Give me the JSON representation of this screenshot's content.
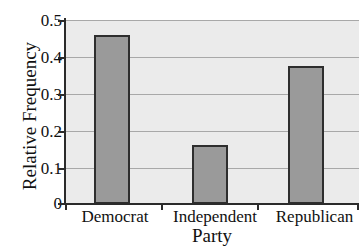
{
  "chart_data": {
    "type": "bar",
    "title": "",
    "xlabel": "Party",
    "ylabel": "Relative Frequency",
    "categories": [
      "Democrat",
      "Independent",
      "Republican"
    ],
    "values": [
      0.46,
      0.16,
      0.375
    ],
    "ylim": [
      0,
      0.5
    ],
    "yticks": [
      0,
      0.1,
      0.2,
      0.3,
      0.4,
      0.5
    ],
    "ytick_labels": [
      "0",
      "0.1",
      "0.2",
      "0.3",
      "0.4",
      "0.5"
    ],
    "grid": true,
    "grid_axis": "y",
    "legend": false,
    "legend_position": "none",
    "bar_fill_color": "#9a9a9a",
    "bar_edge_color": "#2e2e2e",
    "plot_background_color": "#ebebeb",
    "gridline_color": "#a8a8a8",
    "axis_color": "#2b2b2b",
    "bars": [
      {
        "category": "Democrat",
        "value": 0.46,
        "value_label": "0.46"
      },
      {
        "category": "Independent",
        "value": 0.16,
        "value_label": "0.16"
      },
      {
        "category": "Republican",
        "value": 0.375,
        "value_label": "0.375"
      }
    ]
  }
}
